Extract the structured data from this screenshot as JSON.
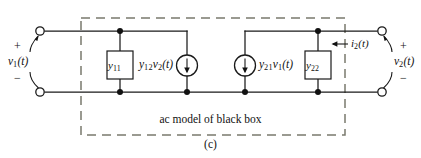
{
  "figure": {
    "label": "(c)",
    "box_caption": "ac model of black box"
  },
  "components": {
    "admittance_input": {
      "name": "y",
      "sub": "11"
    },
    "admittance_output": {
      "name": "y",
      "sub": "22"
    },
    "source_left": {
      "coef": "y",
      "coef_sub": "12",
      "var": "v",
      "var_sub": "2",
      "arg": "(t)"
    },
    "source_right": {
      "coef": "y",
      "coef_sub": "21",
      "var": "v",
      "var_sub": "1",
      "arg": "(t)"
    }
  },
  "ports": {
    "input": {
      "voltage": {
        "var": "v",
        "sub": "1",
        "arg": "(t)"
      },
      "plus": "+",
      "minus": "−"
    },
    "output": {
      "voltage": {
        "var": "v",
        "sub": "2",
        "arg": "(t)"
      },
      "current": {
        "var": "i",
        "sub": "2",
        "arg": "(t)"
      },
      "plus": "+",
      "minus": "−"
    }
  },
  "colors": {
    "wire": "#1a1a1a",
    "dashed_box": "#7a7a6e",
    "background": "#ffffff",
    "text": "#111111"
  }
}
